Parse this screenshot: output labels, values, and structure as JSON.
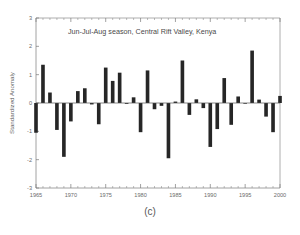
{
  "figure": {
    "caption": "(c)",
    "title": "Jun-Jul-Aug season, Central Rift Valley, Kenya",
    "bar_color": "#262626",
    "axis_color": "#8a8a8a"
  },
  "chart_data": {
    "type": "bar",
    "title": "Jun-Jul-Aug season, Central Rift Valley, Kenya",
    "xlabel": "",
    "ylabel": "Standardized Anomaly",
    "xlim": [
      1965,
      2000
    ],
    "ylim": [
      -3,
      3
    ],
    "yticks": [
      -3,
      -2,
      -1,
      0,
      1,
      2,
      3
    ],
    "xticks": [
      1965,
      1970,
      1975,
      1980,
      1985,
      1990,
      1995,
      2000
    ],
    "xtick_labels": [
      "1965",
      "1970",
      "1975",
      "1980",
      "1985",
      "1990",
      "1995",
      "2000"
    ],
    "ytick_labels": [
      "-3",
      "-2",
      "-1",
      "0",
      "1",
      "2",
      "3"
    ],
    "grid": false,
    "legend": false,
    "zero_reference_line": 0,
    "categories": [
      1965,
      1966,
      1967,
      1968,
      1969,
      1970,
      1971,
      1972,
      1973,
      1974,
      1975,
      1976,
      1977,
      1978,
      1979,
      1980,
      1981,
      1982,
      1983,
      1984,
      1985,
      1986,
      1987,
      1988,
      1989,
      1990,
      1991,
      1992,
      1993,
      1994,
      1995,
      1996,
      1997,
      1998,
      1999,
      2000
    ],
    "values": [
      -1.05,
      1.35,
      0.37,
      -0.95,
      -1.9,
      -0.65,
      0.42,
      0.52,
      -0.05,
      -0.75,
      1.25,
      0.78,
      1.07,
      -0.03,
      0.2,
      -1.03,
      1.15,
      -0.22,
      -0.1,
      -1.95,
      0.05,
      1.5,
      -0.42,
      0.13,
      -0.18,
      -1.55,
      -0.92,
      0.88,
      -0.77,
      0.23,
      -0.02,
      1.85,
      0.12,
      -0.48,
      -1.03,
      0.25
    ]
  }
}
